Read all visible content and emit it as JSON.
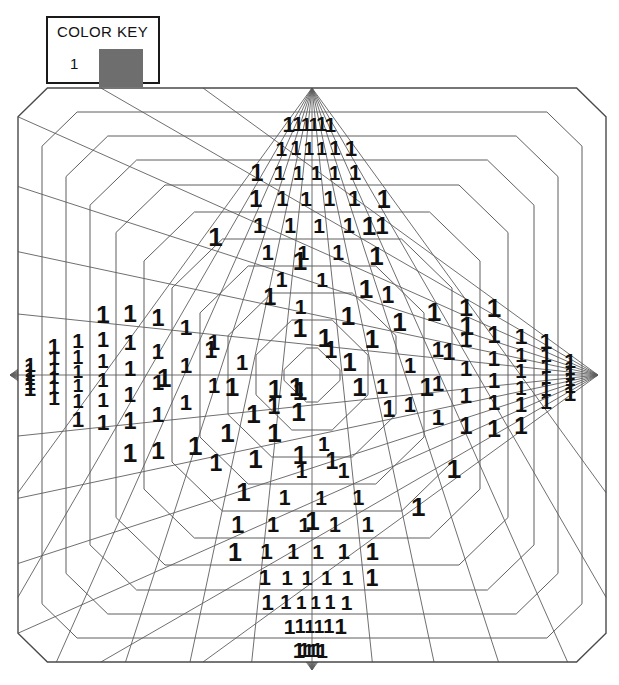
{
  "legend": {
    "title": "COLOR KEY",
    "entries": [
      {
        "number": "1",
        "swatch_color": "#6e6e6e",
        "swatch_name": "gray-swatch"
      }
    ]
  },
  "figure": {
    "kind": "color-by-number-grid",
    "cell_label": "1",
    "background_color": "#ffffff",
    "line_color": "#5f5f5f",
    "digit_color": "#111111",
    "outer_line_color": "#4a4a4a",
    "width": 619,
    "height": 685,
    "center": {
      "x": 312,
      "y": 375
    },
    "vertices": [
      {
        "name": "top-vertex",
        "x": 312,
        "y": 88
      },
      {
        "name": "right-vertex",
        "x": 598,
        "y": 375
      },
      {
        "name": "bottom-vertex",
        "x": 312,
        "y": 670
      },
      {
        "name": "left-vertex",
        "x": 10,
        "y": 375
      }
    ],
    "rings": {
      "count": 11,
      "half_widths": [
        294,
        270,
        246,
        222,
        196,
        168,
        140,
        112,
        84,
        56,
        28
      ],
      "half_heights": [
        287,
        263,
        239,
        215,
        190,
        163,
        136,
        109,
        82,
        55,
        27
      ],
      "bevel_fractions": [
        0.1,
        0.13,
        0.17,
        0.21,
        0.25,
        0.3,
        0.36,
        0.43,
        0.52,
        0.64,
        0.8
      ]
    },
    "rays": {
      "per_vertex": 13,
      "spread_degrees": 72
    }
  }
}
